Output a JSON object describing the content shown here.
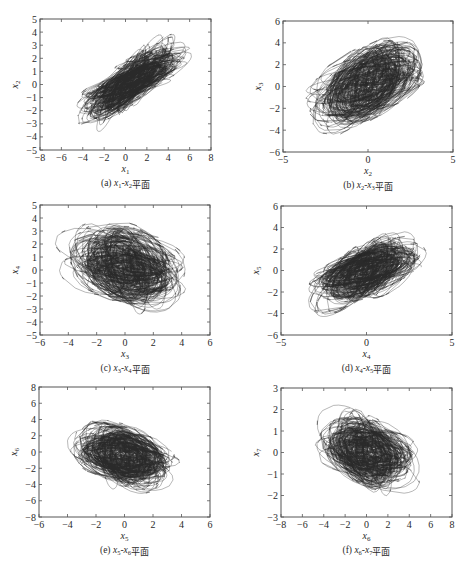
{
  "figure": {
    "panels_count": 6,
    "layout": "3 rows x 2 columns",
    "line_color": "#2b2b2b",
    "axis_color": "#555555"
  },
  "chart_data": [
    {
      "id": "a",
      "type": "line",
      "subtype": "phase-portrait",
      "caption_prefix": "(a)",
      "caption_vars": "x1-x2",
      "caption_suffix": "平面",
      "caption": "(a) x1-x2平面",
      "xlabel": "x1",
      "ylabel": "x2",
      "xlim": [
        -8,
        8
      ],
      "ylim": [
        -5,
        5
      ],
      "xticks": [
        -8,
        -6,
        -4,
        -2,
        0,
        2,
        4,
        6,
        8
      ],
      "yticks": [
        -5,
        -4,
        -3,
        -2,
        -1,
        0,
        1,
        2,
        3,
        4,
        5
      ],
      "trajectory": {
        "center": [
          0.5,
          0.2
        ],
        "x_extent": [
          -6.3,
          6.8
        ],
        "y_extent": [
          -4.0,
          4.2
        ],
        "correlation": "strong positive",
        "shape": "dense elongated ellipse along diagonal"
      },
      "box_px": [
        40,
        19,
        211,
        150
      ]
    },
    {
      "id": "b",
      "type": "line",
      "subtype": "phase-portrait",
      "caption_prefix": "(b)",
      "caption_vars": "x2-x3",
      "caption_suffix": "平面",
      "caption": "(b) x2-x3平面",
      "xlabel": "x2",
      "ylabel": "x3",
      "xlim": [
        -5,
        5
      ],
      "ylim": [
        -6,
        6
      ],
      "xticks": [
        -5,
        0,
        5
      ],
      "yticks": [
        -6,
        -4,
        -2,
        0,
        2,
        4,
        6
      ],
      "trajectory": {
        "center": [
          0,
          0.3
        ],
        "x_extent": [
          -4.4,
          4.2
        ],
        "y_extent": [
          -5.4,
          5.6
        ],
        "correlation": "moderate positive",
        "shape": "dense tilted ellipse with outer loops"
      },
      "box_px": [
        283,
        21,
        453,
        152
      ]
    },
    {
      "id": "c",
      "type": "line",
      "subtype": "phase-portrait",
      "caption_prefix": "(c)",
      "caption_vars": "x3-x4",
      "caption_suffix": "平面",
      "caption": "(c) x3-x4平面",
      "xlabel": "x3",
      "ylabel": "x4",
      "xlim": [
        -6,
        6
      ],
      "ylim": [
        -5,
        5
      ],
      "xticks": [
        -6,
        -4,
        -2,
        0,
        2,
        4,
        6
      ],
      "yticks": [
        -5,
        -4,
        -3,
        -2,
        -1,
        0,
        1,
        2,
        3,
        4,
        5
      ],
      "trajectory": {
        "center": [
          0,
          0.3
        ],
        "x_extent": [
          -5.5,
          5.5
        ],
        "y_extent": [
          -4.5,
          4.1
        ],
        "correlation": "weak negative",
        "shape": "tangled loops, broad cloud"
      },
      "box_px": [
        40,
        205,
        210,
        335
      ]
    },
    {
      "id": "d",
      "type": "line",
      "subtype": "phase-portrait",
      "caption_prefix": "(d)",
      "caption_vars": "x4-x5",
      "caption_suffix": "平面",
      "caption": "(d) x4-x5平面",
      "xlabel": "x4",
      "ylabel": "x5",
      "xlim": [
        -5,
        5
      ],
      "ylim": [
        -6,
        6
      ],
      "xticks": [
        -5,
        0,
        5
      ],
      "yticks": [
        -6,
        -4,
        -2,
        0,
        2,
        4,
        6
      ],
      "trajectory": {
        "center": [
          0,
          0
        ],
        "x_extent": [
          -4.3,
          4.0
        ],
        "y_extent": [
          -5.2,
          4.0
        ],
        "correlation": "positive",
        "shape": "tangled loops along diagonal band"
      },
      "box_px": [
        281,
        206,
        452,
        335
      ]
    },
    {
      "id": "e",
      "type": "line",
      "subtype": "phase-portrait",
      "caption_prefix": "(e)",
      "caption_vars": "x5-x6",
      "caption_suffix": "平面",
      "caption": "(e) x5-x6平面",
      "xlabel": "x5",
      "ylabel": "x6",
      "xlim": [
        -6,
        6
      ],
      "ylim": [
        -8,
        8
      ],
      "xticks": [
        -6,
        -4,
        -2,
        0,
        2,
        4,
        6
      ],
      "yticks": [
        -8,
        -6,
        -4,
        -2,
        0,
        2,
        4,
        6,
        8
      ],
      "trajectory": {
        "center": [
          0,
          -0.5
        ],
        "x_extent": [
          -5.2,
          4.0
        ],
        "y_extent": [
          -6.5,
          4.6
        ],
        "correlation": "weak negative",
        "shape": "overlapping loops"
      },
      "box_px": [
        39,
        387,
        210,
        517
      ]
    },
    {
      "id": "f",
      "type": "line",
      "subtype": "phase-portrait",
      "caption_prefix": "(f)",
      "caption_vars": "x6-x7",
      "caption_suffix": "平面",
      "caption": "(f) x6-x7平面",
      "xlabel": "x6",
      "ylabel": "x7",
      "xlim": [
        -8,
        8
      ],
      "ylim": [
        -3,
        3
      ],
      "xticks": [
        -8,
        -6,
        -4,
        -2,
        0,
        2,
        4,
        6,
        8
      ],
      "yticks": [
        -3,
        -2,
        -1,
        0,
        1,
        2,
        3
      ],
      "trajectory": {
        "center": [
          0,
          0
        ],
        "x_extent": [
          -6.2,
          5.5
        ],
        "y_extent": [
          -2.7,
          2.3
        ],
        "correlation": "weak negative",
        "shape": "dense tangled cloud"
      },
      "box_px": [
        281,
        388,
        452,
        517
      ]
    }
  ]
}
